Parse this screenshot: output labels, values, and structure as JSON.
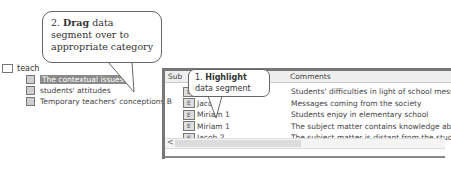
{
  "tree": {
    "root_label": "teach",
    "items": [
      {
        "label": "The contextual issues",
        "selected": true
      },
      {
        "label": "students' attitudes",
        "selected": false
      },
      {
        "label": "Temporary teachers' conceptions B",
        "selected": false
      }
    ]
  },
  "grid": {
    "columns": [
      "Sub",
      "Comments"
    ],
    "rows": [
      {
        "source": "Jacob",
        "comment": "Students' difficulties in light of school messages",
        "selected": true
      },
      {
        "source": "Jacob",
        "comment": "Messages coming from the society",
        "selected": false
      },
      {
        "source": "Miriam 1",
        "comment": "Students enjoy in elementary school",
        "selected": false
      },
      {
        "source": "Miriam 1",
        "comment": "The subject matter contains knowledge about herit.",
        "selected": false
      },
      {
        "source": "Jacob 2",
        "comment": "The subject matter is distant from the student",
        "selected": false
      }
    ],
    "scroll_left_arrow": "<"
  },
  "callouts": {
    "step2": {
      "number": "2.",
      "bold": "Drag",
      "rest": "data segment over to appropriate category"
    },
    "step1": {
      "number": "1.",
      "bold": "Highlight",
      "rest": "data segment"
    }
  },
  "icons": {
    "doc": "E"
  }
}
